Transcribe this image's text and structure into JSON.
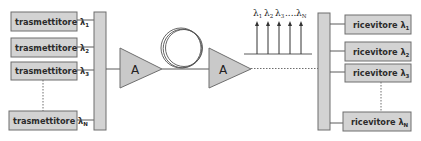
{
  "diagram": {
    "transmitters": [
      {
        "label": "trasmettitore",
        "symbol": "λ",
        "sub": "1"
      },
      {
        "label": "trasmettitore",
        "symbol": "λ",
        "sub": "2"
      },
      {
        "label": "trasmettitore",
        "symbol": "λ",
        "sub": "3"
      },
      {
        "label": "trasmettitore",
        "symbol": "λ",
        "sub": "N"
      }
    ],
    "receivers": [
      {
        "label": "ricevitore",
        "symbol": "λ",
        "sub": "1"
      },
      {
        "label": "ricevitore",
        "symbol": "λ",
        "sub": "2"
      },
      {
        "label": "ricevitore",
        "symbol": "λ",
        "sub": "3"
      },
      {
        "label": "ricevitore",
        "symbol": "λ",
        "sub": "N"
      }
    ],
    "amplifiers": [
      {
        "label": "A"
      },
      {
        "label": "A"
      }
    ],
    "spectrum": {
      "labels": [
        {
          "symbol": "λ",
          "sub": "1"
        },
        {
          "symbol": "λ",
          "sub": "2"
        },
        {
          "symbol": "λ",
          "sub": "3"
        },
        {
          "symbol": "....",
          "sub": ""
        },
        {
          "symbol": "λ",
          "sub": "N"
        }
      ]
    },
    "colors": {
      "fill": "#d3d3d3",
      "stroke": "#6e6e6e",
      "text": "#2b2b2b"
    }
  }
}
